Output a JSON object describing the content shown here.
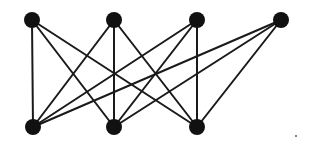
{
  "diagram": {
    "type": "bipartite-graph",
    "width": 309,
    "height": 146,
    "colors": {
      "background": "#ffffff",
      "node": "#111111",
      "edge": "#1a1a1a"
    },
    "node_radius": 8,
    "edge_width": 2,
    "nodes": [
      {
        "id": "T1",
        "row": "top",
        "x": 32,
        "y": 20
      },
      {
        "id": "T2",
        "row": "top",
        "x": 114,
        "y": 20
      },
      {
        "id": "T3",
        "row": "top",
        "x": 197,
        "y": 20
      },
      {
        "id": "T4",
        "row": "top",
        "x": 281,
        "y": 20
      },
      {
        "id": "B1",
        "row": "bottom",
        "x": 33,
        "y": 127
      },
      {
        "id": "B2",
        "row": "bottom",
        "x": 114,
        "y": 127
      },
      {
        "id": "B3",
        "row": "bottom",
        "x": 197,
        "y": 127
      }
    ],
    "edges": [
      [
        "T1",
        "B1"
      ],
      [
        "T1",
        "B2"
      ],
      [
        "T1",
        "B3"
      ],
      [
        "T2",
        "B1"
      ],
      [
        "T2",
        "B2"
      ],
      [
        "T2",
        "B3"
      ],
      [
        "T3",
        "B1"
      ],
      [
        "T3",
        "B2"
      ],
      [
        "T3",
        "B3"
      ],
      [
        "T4",
        "B1"
      ],
      [
        "T4",
        "B2"
      ],
      [
        "T4",
        "B3"
      ]
    ],
    "stray_mark": {
      "x": 296,
      "y": 136,
      "r": 1
    }
  }
}
